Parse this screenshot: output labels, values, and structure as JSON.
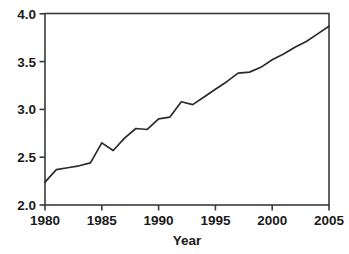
{
  "chart_data": {
    "type": "line",
    "title": "",
    "xlabel": "Year",
    "ylabel": "",
    "xlim": [
      1980,
      2005
    ],
    "ylim": [
      2.0,
      4.0
    ],
    "grid": false,
    "legend": false,
    "xticks": [
      1980,
      1985,
      1990,
      1995,
      2000,
      2005
    ],
    "xtick_labels": [
      "1980",
      "1985",
      "1990",
      "1995",
      "2000",
      "2005"
    ],
    "yticks": [
      2.0,
      2.5,
      3.0,
      3.5,
      4.0
    ],
    "ytick_labels": [
      "2.0",
      "2.5",
      "3.0",
      "3.5",
      "4.0"
    ],
    "line_color": "#2b2b2b",
    "x": [
      1980,
      1981,
      1982,
      1983,
      1984,
      1985,
      1986,
      1987,
      1988,
      1989,
      1990,
      1991,
      1992,
      1993,
      1994,
      1995,
      1996,
      1997,
      1998,
      1999,
      2000,
      2001,
      2002,
      2003,
      2004,
      2005
    ],
    "values": [
      2.24,
      2.37,
      2.39,
      2.41,
      2.44,
      2.65,
      2.57,
      2.7,
      2.8,
      2.79,
      2.9,
      2.92,
      3.08,
      3.05,
      3.13,
      3.21,
      3.29,
      3.38,
      3.39,
      3.44,
      3.52,
      3.58,
      3.65,
      3.71,
      3.79,
      3.87
    ],
    "series": [
      {
        "name": "series-1",
        "values": [
          2.24,
          2.37,
          2.39,
          2.41,
          2.44,
          2.65,
          2.57,
          2.7,
          2.8,
          2.79,
          2.9,
          2.92,
          3.08,
          3.05,
          3.13,
          3.21,
          3.29,
          3.38,
          3.39,
          3.44,
          3.52,
          3.58,
          3.65,
          3.71,
          3.79,
          3.87
        ]
      }
    ]
  },
  "axes": {
    "x_title": "Year",
    "y_tick_0": "2.0",
    "y_tick_1": "2.5",
    "y_tick_2": "3.0",
    "y_tick_3": "3.5",
    "y_tick_4": "4.0",
    "x_tick_0": "1980",
    "x_tick_1": "1985",
    "x_tick_2": "1990",
    "x_tick_3": "1995",
    "x_tick_4": "2000",
    "x_tick_5": "2005"
  }
}
